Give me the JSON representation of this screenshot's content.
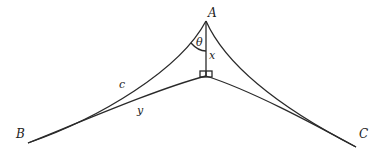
{
  "diagram": {
    "type": "spherical-triangle-geometry",
    "labels": {
      "vertex_a": "A",
      "vertex_b": "B",
      "vertex_c": "C",
      "angle": "θ",
      "altitude": "x",
      "side_ab": "c",
      "segment_b_foot": "y"
    },
    "colors": {
      "line": "#2a2a2a",
      "text": "#222222",
      "background": "#ffffff"
    }
  }
}
